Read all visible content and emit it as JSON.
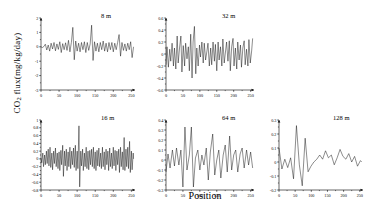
{
  "figure": {
    "ylabel": "CO2 flux(mg/kg/day)",
    "ylabel_prefix": "CO",
    "ylabel_sub": "2",
    "ylabel_suffix": " flux(mg/kg/day)",
    "xlabel": "Position",
    "line_color": "#000000",
    "axis_color": "#000000",
    "background": "#ffffff"
  },
  "chart_data": [
    {
      "type": "line",
      "title": "8 m",
      "panel_id": "panel-8m",
      "xlabel": "",
      "ylabel": "",
      "xlim": [
        0,
        260
      ],
      "ylim": [
        -3,
        2
      ],
      "xticks": [
        0,
        50,
        100,
        150,
        200,
        250
      ],
      "yticks": [
        -3,
        -2,
        -1,
        0,
        1,
        2
      ],
      "grid": false,
      "legend": "none",
      "n_points": 256,
      "note": "High-frequency detail scale; dense noise band centered on 0 with spikes to +1.4 and -1.0",
      "x": [
        0,
        4,
        8,
        12,
        16,
        20,
        24,
        28,
        32,
        36,
        40,
        44,
        48,
        52,
        56,
        60,
        64,
        68,
        72,
        76,
        80,
        84,
        88,
        92,
        96,
        100,
        104,
        108,
        112,
        116,
        120,
        124,
        128,
        132,
        136,
        140,
        144,
        148,
        152,
        156,
        160,
        164,
        168,
        172,
        176,
        180,
        184,
        188,
        192,
        196,
        200,
        204,
        208,
        212,
        216,
        220,
        224,
        228,
        232,
        236,
        240,
        244,
        248,
        252,
        256
      ],
      "values": [
        0.0,
        -0.05,
        0.02,
        0.18,
        -0.22,
        0.12,
        -0.3,
        0.25,
        -0.15,
        0.3,
        -0.28,
        0.2,
        -0.18,
        0.35,
        -0.4,
        0.22,
        -0.2,
        0.28,
        -0.25,
        0.45,
        -0.35,
        0.3,
        1.35,
        -0.9,
        0.4,
        -0.3,
        0.25,
        -0.35,
        0.3,
        -0.2,
        0.35,
        -0.4,
        0.3,
        -0.25,
        0.2,
        1.5,
        -0.95,
        0.35,
        -0.3,
        0.25,
        -0.35,
        0.3,
        -0.2,
        0.4,
        -0.3,
        0.25,
        -0.35,
        0.3,
        -0.2,
        0.3,
        -0.35,
        0.25,
        -0.2,
        0.3,
        0.85,
        -0.65,
        0.3,
        -0.25,
        0.2,
        -0.3,
        0.25,
        -0.2,
        0.35,
        -0.75,
        0.0
      ]
    },
    {
      "type": "line",
      "title": "32 m",
      "panel_id": "panel-32m",
      "xlabel": "",
      "ylabel": "",
      "xlim": [
        0,
        260
      ],
      "ylim": [
        -0.6,
        0.6
      ],
      "xticks": [
        0,
        50,
        100,
        150,
        200,
        250
      ],
      "yticks": [
        -0.6,
        -0.4,
        -0.2,
        0,
        0.2,
        0.4,
        0.6
      ],
      "grid": false,
      "legend": "none",
      "n_points": 80,
      "note": "Medium scale detail; oscillations mostly within +/-0.3 with peaks to 0.46",
      "x": [
        0,
        3,
        7,
        11,
        14,
        18,
        22,
        25,
        29,
        33,
        36,
        40,
        44,
        47,
        51,
        55,
        58,
        62,
        66,
        69,
        73,
        77,
        80,
        84,
        88,
        91,
        95,
        99,
        102,
        106,
        110,
        113,
        117,
        121,
        124,
        128,
        132,
        135,
        139,
        143,
        146,
        150,
        154,
        157,
        161,
        165,
        168,
        172,
        176,
        179,
        183,
        187,
        190,
        194,
        198,
        201,
        205,
        209,
        212,
        216,
        220,
        223,
        227,
        231,
        234,
        238,
        242,
        245,
        249,
        253,
        256
      ],
      "values": [
        -0.18,
        0.12,
        -0.22,
        0.08,
        -0.12,
        0.18,
        -0.2,
        0.1,
        -0.25,
        0.3,
        -0.15,
        0.1,
        0.3,
        -0.3,
        0.14,
        -0.2,
        0.18,
        -0.08,
        0.12,
        -0.28,
        0.33,
        -0.4,
        0.2,
        0.46,
        -0.33,
        0.1,
        -0.2,
        0.15,
        -0.05,
        0.2,
        -0.15,
        0.18,
        -0.1,
        0.05,
        0.18,
        -0.2,
        0.1,
        -0.18,
        0.2,
        -0.12,
        0.16,
        -0.28,
        0.2,
        -0.1,
        0.12,
        -0.2,
        0.25,
        -0.15,
        0.05,
        0.2,
        -0.12,
        0.22,
        -0.28,
        0.12,
        0.26,
        -0.2,
        0.1,
        -0.25,
        0.2,
        -0.1,
        0.15,
        -0.22,
        0.1,
        0.22,
        -0.18,
        0.08,
        -0.2,
        0.24,
        -0.15,
        0.05,
        0.26
      ]
    },
    {
      "type": "line",
      "title": "16 m",
      "panel_id": "panel-16m",
      "xlabel": "",
      "ylabel": "",
      "xlim": [
        0,
        260
      ],
      "ylim": [
        -0.8,
        1.0
      ],
      "xticks": [
        0,
        50,
        100,
        150,
        200,
        250
      ],
      "yticks": [
        -0.8,
        -0.6,
        -0.4,
        -0.2,
        0,
        0.2,
        0.4,
        0.6,
        0.8,
        1.0
      ],
      "grid": false,
      "legend": "none",
      "n_points": 128,
      "note": "Dense oscillation band mostly +/-0.25 with large spikes near x=105 (+0.85 / -0.72)",
      "x": [
        0,
        2,
        5,
        7,
        10,
        12,
        15,
        17,
        20,
        22,
        25,
        27,
        30,
        32,
        35,
        37,
        40,
        42,
        45,
        47,
        50,
        52,
        55,
        57,
        60,
        62,
        65,
        67,
        70,
        72,
        75,
        77,
        80,
        82,
        85,
        87,
        90,
        92,
        95,
        97,
        100,
        102,
        105,
        107,
        110,
        112,
        115,
        117,
        120,
        122,
        125,
        127,
        130,
        132,
        135,
        137,
        140,
        142,
        145,
        147,
        150,
        152,
        155,
        157,
        160,
        162,
        165,
        167,
        170,
        172,
        175,
        177,
        180,
        182,
        185,
        187,
        190,
        192,
        195,
        197,
        200,
        202,
        205,
        207,
        210,
        212,
        215,
        217,
        220,
        222,
        225,
        227,
        230,
        232,
        235,
        237,
        240,
        242,
        245,
        247,
        250,
        252,
        255,
        256
      ],
      "values": [
        0.02,
        -0.1,
        0.15,
        -0.2,
        0.1,
        -0.15,
        0.2,
        -0.12,
        0.25,
        -0.18,
        0.3,
        -0.22,
        0.15,
        -0.28,
        0.2,
        -0.12,
        0.28,
        -0.2,
        0.15,
        -0.25,
        0.18,
        -0.3,
        0.22,
        -0.15,
        0.35,
        -0.45,
        0.2,
        -0.18,
        0.25,
        -0.3,
        0.18,
        -0.2,
        0.3,
        -0.25,
        0.2,
        -0.15,
        0.28,
        -0.22,
        0.35,
        -0.3,
        0.2,
        -0.25,
        0.85,
        -0.72,
        0.2,
        -0.18,
        0.25,
        -0.3,
        0.15,
        -0.2,
        0.3,
        -0.25,
        0.2,
        -0.28,
        0.22,
        -0.15,
        0.25,
        -0.2,
        0.3,
        -0.25,
        0.18,
        -0.3,
        0.22,
        -0.18,
        0.28,
        -0.2,
        0.15,
        -0.25,
        0.3,
        -0.2,
        0.18,
        -0.28,
        0.25,
        -0.15,
        0.2,
        -0.3,
        0.28,
        -0.2,
        0.15,
        -0.25,
        0.3,
        -0.18,
        0.22,
        -0.3,
        0.2,
        -0.15,
        0.25,
        -0.35,
        0.3,
        -0.2,
        0.18,
        -0.28,
        0.55,
        -0.3,
        0.25,
        -0.2,
        0.3,
        -0.25,
        0.45,
        -0.35,
        0.2,
        -0.28,
        0.15,
        0.0
      ]
    },
    {
      "type": "line",
      "title": "64 m",
      "panel_id": "panel-64m",
      "xlabel": "",
      "ylabel": "",
      "xlim": [
        0,
        260
      ],
      "ylim": [
        -0.3,
        0.4
      ],
      "xticks": [
        0,
        50,
        100,
        150,
        200,
        250
      ],
      "yticks": [
        -0.3,
        -0.2,
        -0.1,
        0,
        0.1,
        0.2,
        0.3,
        0.4
      ],
      "grid": false,
      "legend": "none",
      "n_points": 40,
      "note": "Smoother oscillation; two large peaks near x=60 and x=80 reaching 0.33, deep troughs to -0.27",
      "x": [
        0,
        6,
        12,
        19,
        25,
        31,
        38,
        44,
        50,
        56,
        62,
        69,
        75,
        81,
        87,
        94,
        100,
        106,
        112,
        119,
        125,
        131,
        138,
        144,
        150,
        156,
        162,
        169,
        175,
        181,
        188,
        194,
        200,
        206,
        212,
        219,
        225,
        231,
        238,
        244,
        250,
        256
      ],
      "values": [
        -0.12,
        0.06,
        -0.08,
        0.1,
        -0.06,
        0.12,
        -0.05,
        0.1,
        -0.27,
        0.33,
        -0.1,
        0.05,
        0.33,
        -0.27,
        0.02,
        0.1,
        -0.1,
        0.05,
        -0.05,
        0.12,
        -0.2,
        0.08,
        0.26,
        -0.15,
        0.0,
        0.1,
        -0.18,
        0.05,
        0.15,
        -0.12,
        0.24,
        -0.1,
        0.05,
        0.1,
        -0.12,
        0.06,
        0.12,
        -0.08,
        0.1,
        -0.05,
        0.08,
        -0.08
      ]
    },
    {
      "type": "line",
      "title": "128 m",
      "panel_id": "panel-128m",
      "xlabel": "",
      "ylabel": "",
      "xlim": [
        0,
        260
      ],
      "ylim": [
        -0.2,
        0.3
      ],
      "xticks": [
        0,
        50,
        100,
        150,
        200,
        250
      ],
      "yticks": [
        -0.2,
        -0.1,
        0,
        0.1,
        0.2,
        0.3
      ],
      "grid": false,
      "legend": "none",
      "n_points": 30,
      "note": "Smoothest/longest-wavelength scale; dominant peak 0.26 near x=60, trough -0.17 near x=72",
      "x": [
        0,
        9,
        18,
        27,
        36,
        45,
        54,
        63,
        72,
        81,
        90,
        99,
        108,
        117,
        126,
        135,
        144,
        153,
        162,
        171,
        180,
        189,
        198,
        207,
        216,
        225,
        234,
        243,
        252,
        256
      ],
      "values": [
        0.1,
        -0.05,
        0.02,
        -0.04,
        0.03,
        -0.12,
        0.26,
        -0.02,
        -0.17,
        0.17,
        -0.07,
        -0.03,
        0.0,
        0.02,
        0.05,
        0.02,
        0.08,
        0.03,
        0.05,
        -0.02,
        0.03,
        0.09,
        0.04,
        0.02,
        0.06,
        0.0,
        0.04,
        -0.03,
        0.01,
        0.0
      ]
    }
  ]
}
